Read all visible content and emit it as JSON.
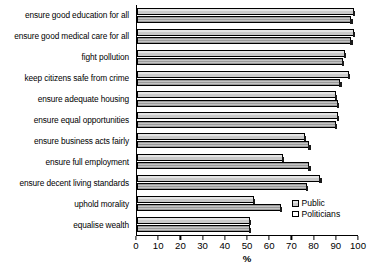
{
  "chart_data": {
    "type": "bar",
    "orientation": "horizontal",
    "title": "",
    "subtitle": "",
    "xlabel": "%",
    "ylabel": "",
    "xlim": [
      0,
      100
    ],
    "xticks": [
      0,
      10,
      20,
      30,
      40,
      50,
      60,
      70,
      80,
      90,
      100
    ],
    "xtick_labels": [
      "0",
      "10",
      "20",
      "30",
      "40",
      "50",
      "60",
      "70",
      "80",
      "90",
      "100"
    ],
    "grid": false,
    "legend_position": "inside-bottom-right",
    "categories": [
      "ensure good education for all",
      "ensure good medical care for all",
      "fight pollution",
      "keep citizens safe from crime",
      "ensure adequate housing",
      "ensure equal opportunities",
      "ensure business acts fairly",
      "ensure full employment",
      "ensure decent living standards",
      "uphold morality",
      "equalise wealth"
    ],
    "series": [
      {
        "name": "Public",
        "color": "#d6d6d6",
        "values": [
          98,
          98,
          94,
          96,
          90,
          91,
          76,
          66,
          83,
          53,
          51
        ]
      },
      {
        "name": "Politicians",
        "color": "#a6a6a6",
        "values": [
          97,
          97,
          93,
          92,
          91,
          90,
          78,
          78,
          77,
          65,
          51
        ]
      }
    ]
  },
  "legend": {
    "items": [
      {
        "label": "Public"
      },
      {
        "label": "Politicians"
      }
    ]
  },
  "axis": {
    "x_title": "%"
  }
}
